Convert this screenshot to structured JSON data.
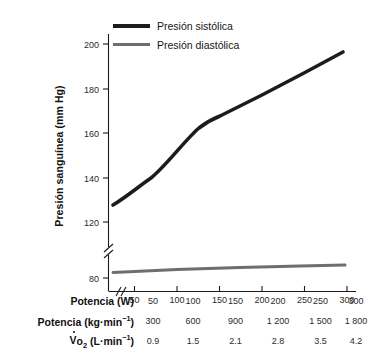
{
  "chart_data": {
    "type": "line",
    "title": "",
    "xlabel": "Potencia (W)",
    "ylabel": "Presión sanguínea (mm Hg)",
    "x": [
      50,
      100,
      150,
      200,
      250,
      300
    ],
    "xticklabels": [
      "50",
      "100",
      "150",
      "200",
      "250",
      "300"
    ],
    "yticklabels": [
      "80",
      "120",
      "140",
      "160",
      "180",
      "200"
    ],
    "ylim": [
      80,
      208
    ],
    "xlim": [
      50,
      300
    ],
    "axis_break": true,
    "axis_break_note": "y-axis broken between 80 and 120",
    "grid": false,
    "legend_position": "top-left",
    "series": [
      {
        "name": "Presión sistólica",
        "color": "#1c1c1c",
        "values": [
          126,
          143,
          164,
          175,
          186,
          196
        ]
      },
      {
        "name": "Presión diastólica",
        "color": "#6e6e6e",
        "values": [
          81,
          82,
          83,
          84,
          85,
          86
        ]
      }
    ]
  },
  "legend": {
    "items": [
      {
        "label": "Presión sistólica",
        "color": "#1c1c1c"
      },
      {
        "label": "Presión diastólica",
        "color": "#6e6e6e"
      }
    ]
  },
  "axes": {
    "y_title": "Presión sanguínea (mm Hg)",
    "y_ticks": [
      "200",
      "180",
      "160",
      "140",
      "120",
      "80"
    ],
    "x_ticks": [
      "50",
      "100",
      "150",
      "200",
      "250",
      "300"
    ]
  },
  "table": {
    "rows": [
      {
        "label_plain": "Potencia (W)",
        "label_html": "Potencia (W)",
        "values": [
          "50",
          "100",
          "150",
          "200",
          "250",
          "300"
        ]
      },
      {
        "label_plain": "Potencia (kg·min⁻¹)",
        "label_html": "Potencia (kg&middot;min<sup>&minus;1</sup>)",
        "values": [
          "300",
          "600",
          "900",
          "1 200",
          "1 500",
          "1 800"
        ]
      },
      {
        "label_plain": "V̇o₂ (L·min⁻¹)",
        "label_html": "<span class=\"vdot\">V</span>o<sub>2</sub> (L&middot;min<sup>&minus;1</sup>)",
        "values": [
          "0.9",
          "1.5",
          "2.1",
          "2.8",
          "3.5",
          "4.2"
        ]
      }
    ]
  }
}
